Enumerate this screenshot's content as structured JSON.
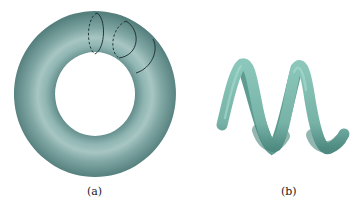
{
  "figure": {
    "panels": [
      {
        "id": "a",
        "label": "(a)",
        "description": "torus with circular cross-section rings"
      },
      {
        "id": "b",
        "label": "(b)",
        "description": "helical tube"
      }
    ],
    "colors": {
      "torus_base": "#6f9c9a",
      "torus_light": "#a9c9c6",
      "torus_dark": "#4f7a78",
      "helix_base": "#7fbcb0",
      "helix_dark": "#4e8a80",
      "ring_line": "#1a2a2a"
    }
  }
}
